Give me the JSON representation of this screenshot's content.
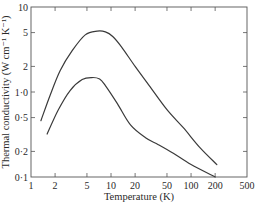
{
  "chart_data": {
    "type": "line",
    "title": "",
    "xlabel": "Temperature (K)",
    "ylabel": "Thermal conductivity (W cm⁻¹ K⁻¹)",
    "xscale": "log",
    "yscale": "log",
    "xlim": [
      1,
      500
    ],
    "ylim": [
      0.1,
      10
    ],
    "grid": false,
    "legend": null,
    "x_ticks": [
      1,
      2,
      5,
      10,
      20,
      50,
      100,
      200,
      500
    ],
    "x_tick_labels": [
      "1",
      "2",
      "5",
      "10",
      "20",
      "50",
      "100",
      "200",
      "500"
    ],
    "y_ticks": [
      0.1,
      0.2,
      0.5,
      1.0,
      2,
      5,
      10
    ],
    "y_tick_labels": [
      "0·1",
      "0·2",
      "0·5",
      "1·0",
      "2",
      "5",
      "10"
    ],
    "series": [
      {
        "name": "upper curve",
        "points": [
          [
            1.33,
            0.46
          ],
          [
            1.73,
            0.91
          ],
          [
            2.31,
            1.78
          ],
          [
            3.27,
            3.06
          ],
          [
            4.76,
            4.7
          ],
          [
            6.7,
            5.2
          ],
          [
            8.5,
            5.1
          ],
          [
            10.5,
            4.5
          ],
          [
            13.5,
            3.4
          ],
          [
            20,
            2.0
          ],
          [
            30,
            1.19
          ],
          [
            50,
            0.62
          ],
          [
            80,
            0.38
          ],
          [
            130,
            0.22
          ],
          [
            210,
            0.14
          ]
        ]
      },
      {
        "name": "lower curve",
        "points": [
          [
            1.59,
            0.32
          ],
          [
            2.18,
            0.61
          ],
          [
            3.08,
            1.04
          ],
          [
            4.36,
            1.4
          ],
          [
            5.8,
            1.48
          ],
          [
            7.2,
            1.42
          ],
          [
            8.5,
            1.19
          ],
          [
            12,
            0.73
          ],
          [
            17.5,
            0.41
          ],
          [
            27,
            0.29
          ],
          [
            39,
            0.24
          ],
          [
            60,
            0.19
          ],
          [
            100,
            0.14
          ],
          [
            200,
            0.1
          ]
        ]
      }
    ]
  },
  "plot_area": {
    "left": 31,
    "top": 7,
    "right": 247,
    "bottom": 177
  },
  "colors": {
    "curve": "#3a3a3a",
    "axis": "#555555",
    "text": "#2a2a2a",
    "background": "#ffffff"
  }
}
